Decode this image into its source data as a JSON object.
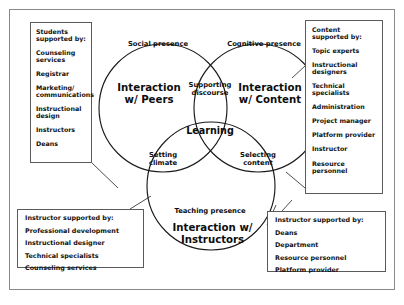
{
  "diagram": {
    "circles": [
      {
        "id": "peers",
        "label": "Interaction\nw/ Peers"
      },
      {
        "id": "content",
        "label": "Interaction\nw/ Content"
      },
      {
        "id": "instructors",
        "label": "Interaction w/ Instructors"
      }
    ],
    "arc_labels": {
      "social": "Social presence",
      "cognitive": "Cognitive presence",
      "teaching": "Teaching presence"
    },
    "overlap_labels": {
      "center": "Learning",
      "top": "Supporting\ndiscourse",
      "left": "Setting\nclimate",
      "right": "Selecting\ncontent"
    }
  },
  "boxes": {
    "students": {
      "title": "Students\nsupported by:",
      "items": [
        "Counseling\nservices",
        "Registrar",
        "Marketing/\ncommunications",
        "Instructional\ndesign",
        "Instructors",
        "Deans"
      ]
    },
    "content": {
      "title": "Content\nsupported by:",
      "items": [
        "Topic experts",
        "Instructional\ndesigners",
        "Technical\nspecialists",
        "Administration",
        "Project manager",
        "Platform provider",
        "Instructor",
        "Resource\npersonnel"
      ]
    },
    "instructor_left": {
      "title": "Instructor supported by:",
      "items": [
        "Professional development",
        "Instructional designer",
        "Technical specialists",
        "Counseling services"
      ]
    },
    "instructor_right": {
      "title": "Instructor supported by:",
      "items": [
        "Deans",
        "Department",
        "Resource personnel",
        "Platform provider"
      ]
    }
  },
  "colors": {
    "frame": "#8a8a8a",
    "box_border": "#5a5a5a",
    "circle_stroke": "#1a1a1a",
    "text": "#111111",
    "background": "#ffffff"
  }
}
